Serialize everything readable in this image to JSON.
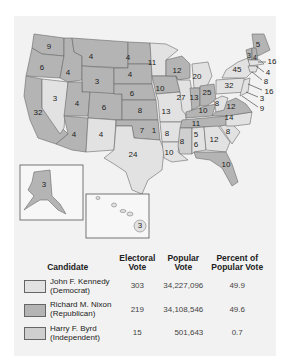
{
  "colors": {
    "kennedy": "#e2e2e2",
    "nixon": "#b4b4b4",
    "byrd": "#cfcfcf",
    "background": "#f2f2f2",
    "border": "#6a6a6a"
  },
  "map": {
    "states": {
      "WA": "9",
      "OR": "6",
      "CA": "32",
      "ID": "4",
      "NV": "3",
      "MT": "4",
      "WY": "3",
      "UT": "4",
      "CO": "6",
      "AZ": "4",
      "NM": "4",
      "ND": "4",
      "SD": "4",
      "NE": "6",
      "KS": "8",
      "OK_nixon": "7",
      "OK_byrd": "1",
      "TX": "24",
      "MN": "11",
      "IA": "10",
      "MO": "13",
      "AR": "8",
      "LA": "10",
      "WI": "12",
      "IL": "27",
      "MI": "20",
      "IN": "13",
      "OH": "25",
      "KY": "10",
      "TN": "11",
      "MS": "8",
      "AL_kennedy": "5",
      "AL_byrd": "6",
      "GA": "12",
      "FL": "10",
      "SC": "8",
      "NC": "14",
      "VA": "12",
      "WV": "8",
      "PA": "32",
      "NY": "45",
      "ME": "5",
      "VT": "3",
      "NH": "4",
      "MA": "16",
      "RI": "4",
      "CT": "8",
      "NJ": "16",
      "DE": "3",
      "MD": "9",
      "AK": "3",
      "HI": "3"
    }
  },
  "legend": {
    "headers": {
      "candidate": "Candidate",
      "electoral_1": "Electoral",
      "electoral_2": "Vote",
      "popular_1": "Popular",
      "popular_2": "Vote",
      "percent_1": "Percent of",
      "percent_2": "Popular Vote"
    },
    "rows": [
      {
        "name": "John F. Kennedy",
        "party": "(Democrat)",
        "electoral": "303",
        "popular": "34,227,096",
        "percent": "49.9"
      },
      {
        "name": "Richard M. Nixon",
        "party": "(Republican)",
        "electoral": "219",
        "popular": "34,108,546",
        "percent": "49.6"
      },
      {
        "name": "Harry F. Byrd",
        "party": "(Independent)",
        "electoral": "15",
        "popular": "501,643",
        "percent": "0.7"
      }
    ]
  }
}
